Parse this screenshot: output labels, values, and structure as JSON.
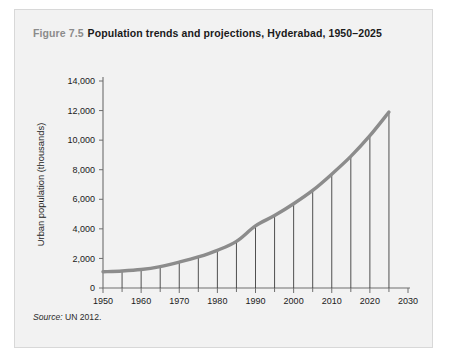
{
  "figure": {
    "number": "Figure 7.5",
    "title": "Population trends and projections, Hyderabad, 1950–2025",
    "source_label": "Source:",
    "source_text": "UN 2012."
  },
  "chart_data": {
    "type": "line",
    "title": "Population trends and projections, Hyderabad, 1950–2025",
    "xlabel": "",
    "ylabel": "Urban population (thousands)",
    "xlim": [
      1950,
      2030
    ],
    "ylim": [
      0,
      14000
    ],
    "grid": false,
    "legend": "none",
    "x_tick_labels": [
      "1950",
      "1960",
      "1970",
      "1980",
      "1990",
      "2000",
      "2010",
      "2020",
      "2030"
    ],
    "x_major_ticks": [
      1950,
      1960,
      1970,
      1980,
      1990,
      2000,
      2010,
      2020,
      2030
    ],
    "x_minor_ticks": [
      1955,
      1965,
      1975,
      1985,
      1995,
      2005,
      2015,
      2025
    ],
    "y_tick_labels": [
      "0",
      "2,000",
      "4,000",
      "6,000",
      "8,000",
      "10,000",
      "12,000",
      "14,000"
    ],
    "y_ticks": [
      0,
      2000,
      4000,
      6000,
      8000,
      10000,
      12000,
      14000
    ],
    "x": [
      1950,
      1955,
      1960,
      1965,
      1970,
      1975,
      1980,
      1985,
      1990,
      1995,
      2000,
      2005,
      2010,
      2015,
      2020,
      2025
    ],
    "values": [
      1100,
      1150,
      1250,
      1450,
      1750,
      2100,
      2550,
      3150,
      4200,
      4900,
      5700,
      6600,
      7700,
      8900,
      10300,
      11900
    ],
    "drop_line_years": [
      1955,
      1960,
      1965,
      1970,
      1975,
      1980,
      1985,
      1990,
      1995,
      2000,
      2005,
      2010,
      2015,
      2020,
      2025
    ],
    "series_color": "#8c8c8c",
    "axis_color": "#6e6e6e",
    "panel_color": "#f2f2f2"
  }
}
